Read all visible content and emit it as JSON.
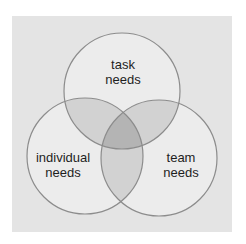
{
  "diagram": {
    "type": "venn",
    "colors": {
      "page_background": "#ffffff",
      "panel_background": "#e4e4e4",
      "circle_fill": "#ececec",
      "pair_overlap_fill": "#d2d2d2",
      "center_overlap_fill": "#b4b4b4",
      "outline": "#8c8c8c",
      "text": "#1e1e1e"
    },
    "circles": [
      {
        "id": "task",
        "lines": [
          "task",
          "needs"
        ]
      },
      {
        "id": "individual",
        "lines": [
          "individual",
          "needs"
        ]
      },
      {
        "id": "team",
        "lines": [
          "team",
          "needs"
        ]
      }
    ]
  }
}
